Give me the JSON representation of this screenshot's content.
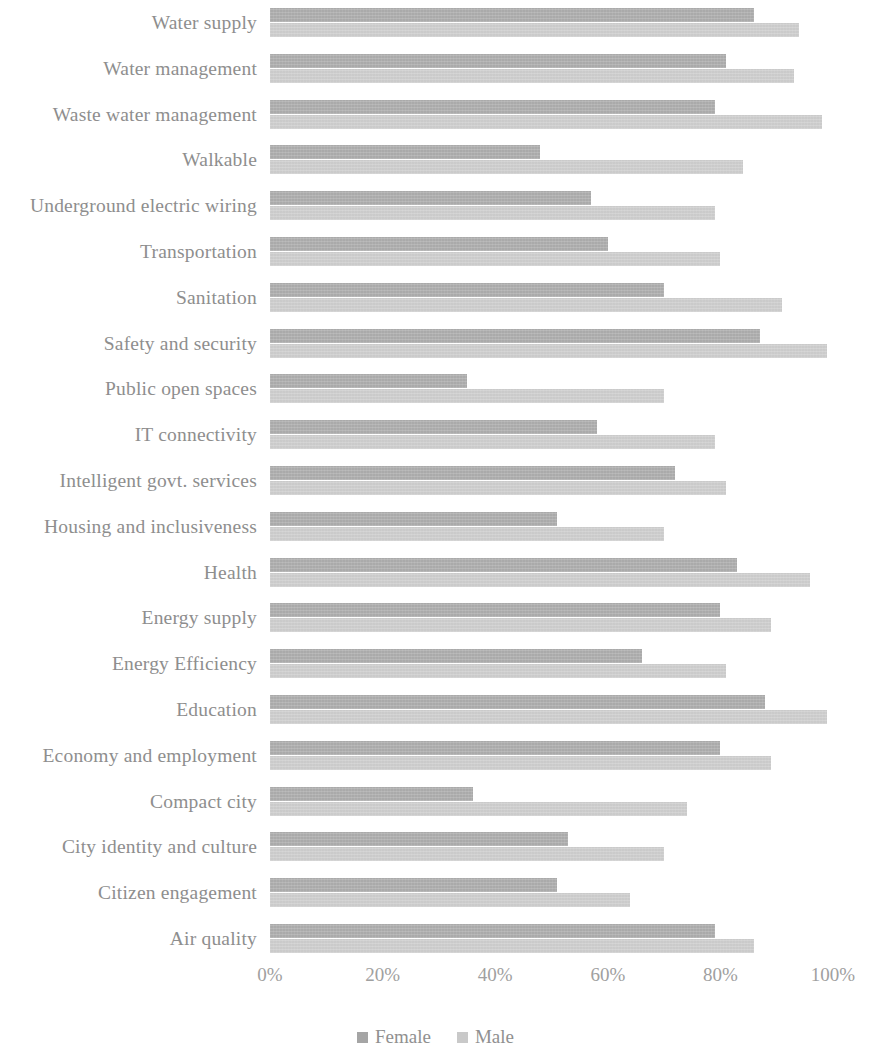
{
  "chart_data": {
    "type": "bar",
    "orientation": "horizontal",
    "title": "",
    "subtitle": "",
    "xlabel": "",
    "ylabel": "",
    "xlim": [
      0,
      100
    ],
    "grid": false,
    "legend_position": "bottom",
    "x_tick_labels": [
      "0%",
      "20%",
      "40%",
      "60%",
      "80%",
      "100%"
    ],
    "x_tick_values": [
      0,
      20,
      40,
      60,
      80,
      100
    ],
    "categories": [
      "Water supply",
      "Water management",
      "Waste water management",
      "Walkable",
      "Underground electric wiring",
      "Transportation",
      "Sanitation",
      "Safety and security",
      "Public open spaces",
      "IT connectivity",
      "Intelligent govt. services",
      "Housing and inclusiveness",
      "Health",
      "Energy supply",
      "Energy Efficiency",
      "Education",
      "Economy and employment",
      "Compact city",
      "City identity and culture",
      "Citizen engagement",
      "Air quality"
    ],
    "series": [
      {
        "name": "Female",
        "color": "#a5a5a5",
        "values": [
          86,
          81,
          79,
          48,
          57,
          60,
          70,
          87,
          35,
          58,
          72,
          51,
          83,
          80,
          66,
          88,
          80,
          36,
          53,
          51,
          79
        ]
      },
      {
        "name": "Male",
        "color": "#c9c9c9",
        "values": [
          94,
          93,
          98,
          84,
          79,
          80,
          91,
          99,
          70,
          79,
          81,
          70,
          96,
          89,
          81,
          99,
          89,
          74,
          70,
          64,
          86
        ]
      }
    ]
  },
  "legend": {
    "items": [
      {
        "label": "Female",
        "color": "#a5a5a5",
        "marker": "square-marker"
      },
      {
        "label": "Male",
        "color": "#c9c9c9",
        "marker": "square-marker"
      }
    ]
  }
}
